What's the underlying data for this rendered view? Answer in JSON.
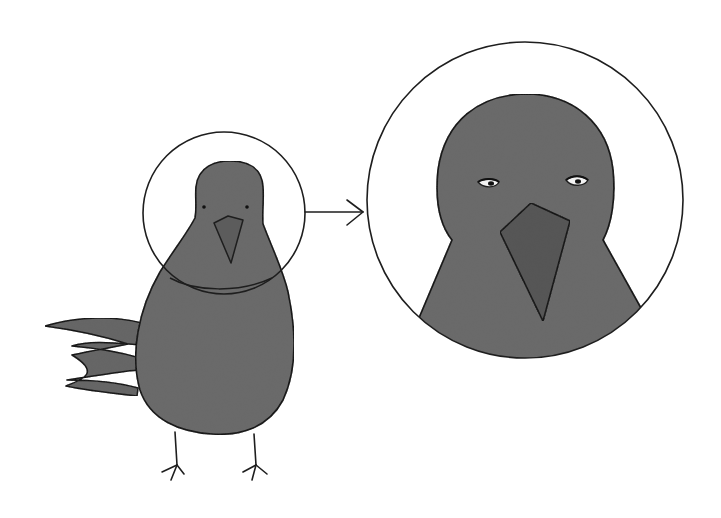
{
  "illustration": {
    "description": "Hand-drawn crayon illustration of a gray bird; its head is circled and an arrow points to an enlarged circle showing a close-up of the bird's head with half-closed eyes and a beak",
    "colors": {
      "background": "#ffffff",
      "outline": "#1e1e1e",
      "body_fill": "#6e6e6e",
      "beak_fill": "#5a5a5a",
      "eye_white": "#f2f2f2"
    },
    "elements": [
      "small-bird",
      "highlight-circle",
      "arrow",
      "zoomed-head-circle"
    ]
  }
}
